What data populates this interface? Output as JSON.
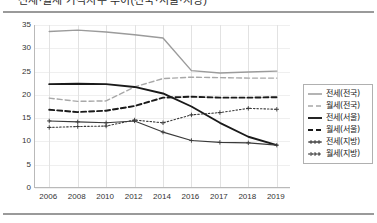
{
  "page": {
    "title_clipped": "전세·월세 가격지수 추이(전국·서울·지방)"
  },
  "chart_data": {
    "type": "line",
    "title": "",
    "xlabel": "",
    "ylabel": "",
    "ylim": [
      0,
      35
    ],
    "yticks": [
      0,
      5,
      10,
      15,
      20,
      25,
      30,
      35
    ],
    "grid": true,
    "legend_position": "right",
    "categories": [
      "2006",
      "2008",
      "2010",
      "2012",
      "2014",
      "2016",
      "2017",
      "2018",
      "2019"
    ],
    "series": [
      {
        "name": "전세(전국)",
        "style": "solid",
        "color": "#9b9b9b",
        "marker": "none",
        "values": [
          33.6,
          33.9,
          33.5,
          32.9,
          32.2,
          25.2,
          24.7,
          24.9,
          25.1
        ]
      },
      {
        "name": "월세(전국)",
        "style": "dashed",
        "color": "#a8a8a8",
        "marker": "none",
        "values": [
          19.3,
          18.6,
          18.7,
          21.7,
          23.5,
          23.8,
          23.7,
          23.6,
          23.6
        ]
      },
      {
        "name": "전세(서울)",
        "style": "solid",
        "color": "#1a1a1a",
        "marker": "none",
        "values": [
          22.3,
          22.4,
          22.3,
          21.7,
          20.3,
          17.5,
          14.0,
          11.0,
          9.2
        ]
      },
      {
        "name": "월세(서울)",
        "style": "dashed",
        "color": "#1a1a1a",
        "marker": "none",
        "values": [
          16.8,
          16.3,
          16.6,
          17.6,
          19.4,
          19.6,
          19.4,
          19.4,
          19.5
        ]
      },
      {
        "name": "전세(지방)",
        "style": "solid-plus",
        "color": "#3a3a3a",
        "marker": "plus",
        "values": [
          14.4,
          14.2,
          14.0,
          14.4,
          12.0,
          10.2,
          9.8,
          9.7,
          9.2
        ]
      },
      {
        "name": "월세(지방)",
        "style": "dotted-plus",
        "color": "#3a3a3a",
        "marker": "plus",
        "values": [
          13.0,
          13.2,
          13.3,
          14.6,
          14.0,
          15.7,
          16.2,
          17.1,
          16.9
        ]
      }
    ]
  },
  "legend": {
    "items": [
      {
        "label": "전세(전국)"
      },
      {
        "label": "월세(전국)"
      },
      {
        "label": "전세(서울)"
      },
      {
        "label": "월세(서울)"
      },
      {
        "label": "전세(지방)"
      },
      {
        "label": "월세(지방)"
      }
    ]
  }
}
